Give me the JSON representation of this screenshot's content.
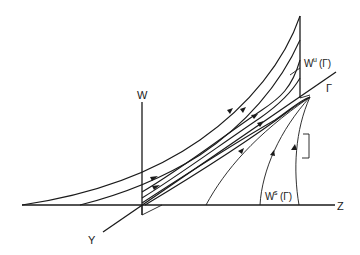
{
  "diagram": {
    "type": "phase-space sketch",
    "axes": {
      "w": "W",
      "z": "Z",
      "y": "Y"
    },
    "labels": {
      "gamma": "Γ",
      "unstable_manifold": "W",
      "unstable_sup": "u",
      "unstable_arg": "(Γ)",
      "stable_manifold": "W",
      "stable_sup": "s",
      "stable_arg": "(Γ)"
    },
    "colors": {
      "ink": "#1a1a1a",
      "background": "#ffffff"
    }
  }
}
